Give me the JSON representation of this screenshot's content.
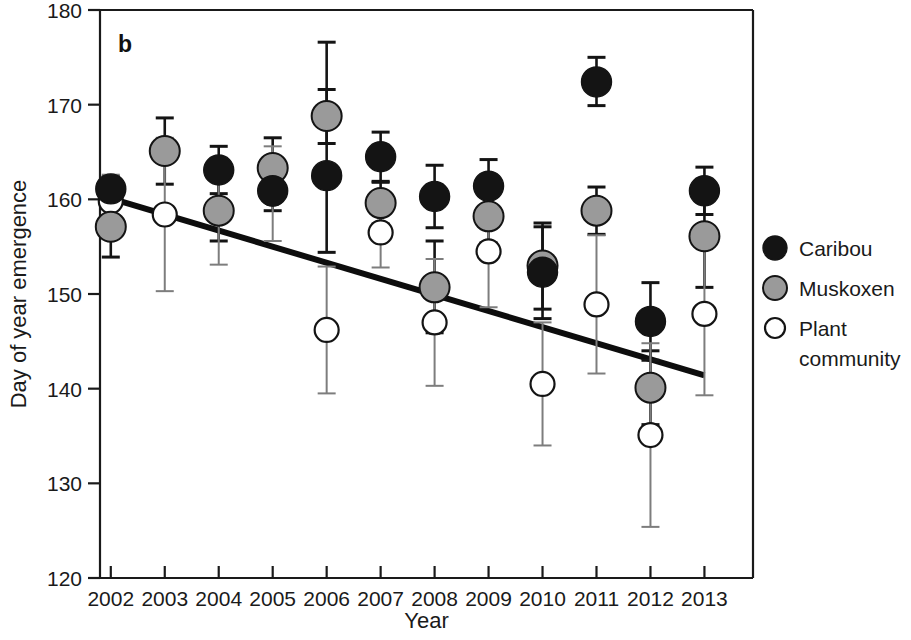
{
  "panel": {
    "label": "b"
  },
  "legend": {
    "position": "right",
    "items": [
      {
        "name": "Caribou",
        "marker": "filled-black-circle",
        "color": "#141414"
      },
      {
        "name": "Muskoxen",
        "marker": "filled-gray-circle",
        "color": "#9a9a9a"
      },
      {
        "name": "Plant community",
        "marker": "open-circle",
        "color": "#ffffff"
      }
    ]
  },
  "chart_data": {
    "type": "scatter",
    "title": "",
    "xlabel": "Year",
    "ylabel": "Day of year emergence",
    "xlim": [
      2001.5,
      2013.5
    ],
    "ylim": [
      120,
      180
    ],
    "ytick_values": [
      120,
      130,
      140,
      150,
      160,
      170,
      180
    ],
    "ytick_labels": [
      "120",
      "130",
      "140",
      "150",
      "160",
      "170",
      "180"
    ],
    "grid": false,
    "categories": [
      2002,
      2003,
      2004,
      2005,
      2006,
      2007,
      2008,
      2009,
      2010,
      2011,
      2012,
      2013
    ],
    "xtick_labels": [
      "2002",
      "2003",
      "2004",
      "2005",
      "2006",
      "2007",
      "2008",
      "2009",
      "2010",
      "2011",
      "2012",
      "2013"
    ],
    "series": [
      {
        "name": "Caribou",
        "marker": "filled-black-circle",
        "values": [
          161.1,
          null,
          163.1,
          160.9,
          162.5,
          164.5,
          160.3,
          161.4,
          152.3,
          172.4,
          147.1,
          160.9
        ],
        "err_low": [
          159.7,
          null,
          160.6,
          158.8,
          154.4,
          161.9,
          157.0,
          158.6,
          147.4,
          169.9,
          143.0,
          158.4
        ],
        "err_high": [
          162.4,
          null,
          165.6,
          163.2,
          176.6,
          167.1,
          163.6,
          164.2,
          157.1,
          175.0,
          151.2,
          163.4
        ]
      },
      {
        "name": "Muskoxen",
        "marker": "filled-gray-circle",
        "values": [
          157.1,
          165.1,
          158.8,
          163.3,
          168.8,
          159.6,
          150.7,
          158.2,
          153.0,
          158.8,
          140.1,
          156.1
        ],
        "err_low": [
          153.9,
          161.6,
          155.6,
          160.0,
          165.9,
          157.4,
          145.9,
          155.4,
          148.4,
          156.3,
          136.2,
          150.7
        ],
        "err_high": [
          160.3,
          168.6,
          162.0,
          166.5,
          171.6,
          161.8,
          155.6,
          161.0,
          157.5,
          161.3,
          144.0,
          161.4
        ]
      },
      {
        "name": "Plant community",
        "marker": "open-circle",
        "values": [
          159.8,
          158.4,
          158.6,
          160.6,
          146.2,
          156.5,
          147.0,
          154.5,
          140.5,
          148.9,
          135.1,
          147.9
        ],
        "err_low": [
          157.0,
          150.3,
          153.1,
          155.6,
          139.5,
          152.8,
          140.3,
          148.6,
          134.0,
          141.6,
          125.4,
          139.3
        ],
        "err_high": [
          162.6,
          166.5,
          164.1,
          165.6,
          152.9,
          160.2,
          153.7,
          160.4,
          147.0,
          156.2,
          144.8,
          156.5
        ]
      }
    ],
    "trendline": {
      "x_start": 2002,
      "y_start": 160.1,
      "x_end": 2013,
      "y_end": 141.4
    }
  }
}
